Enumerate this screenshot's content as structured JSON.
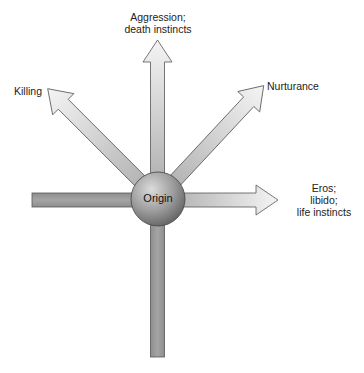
{
  "diagram": {
    "center_label": "Origin",
    "arrows": [
      {
        "id": "up",
        "label_lines": [
          "Aggression;",
          "death instincts"
        ],
        "direction": "up",
        "has_head": true
      },
      {
        "id": "up-left",
        "label_lines": [
          "Killing"
        ],
        "direction": "up-left",
        "has_head": true
      },
      {
        "id": "up-right",
        "label_lines": [
          "Nurturance"
        ],
        "direction": "up-right",
        "has_head": true
      },
      {
        "id": "right",
        "label_lines": [
          "Eros;",
          "libido;",
          "life instincts"
        ],
        "direction": "right",
        "has_head": true
      },
      {
        "id": "left",
        "label_lines": [],
        "direction": "left",
        "has_head": false
      },
      {
        "id": "down",
        "label_lines": [],
        "direction": "down",
        "has_head": false
      }
    ],
    "colors": {
      "arrow_fill_light": "#f2f2f2",
      "arrow_fill_dark": "#a8a8a8",
      "bar_fill": "#9a9a9a",
      "outline": "#555555",
      "sphere_light": "#d8d8d8",
      "sphere_dark": "#6e6e6e"
    }
  }
}
